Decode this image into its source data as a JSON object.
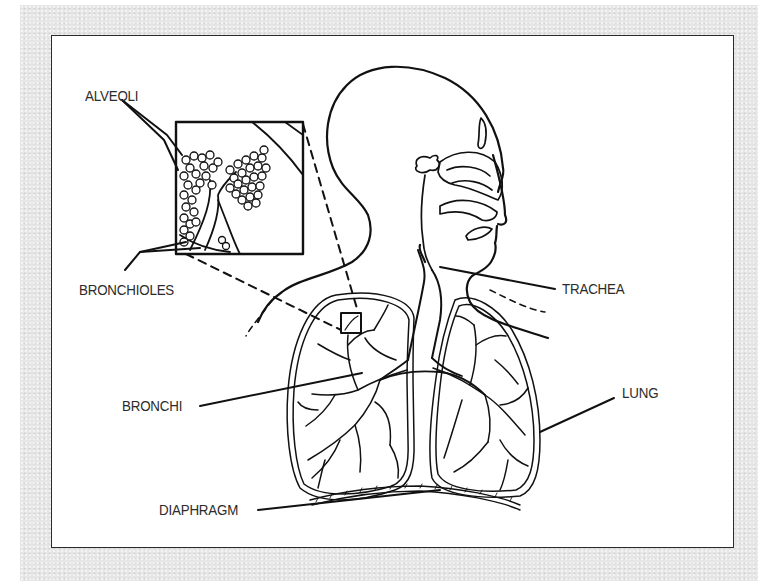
{
  "diagram": {
    "background_color": "#e6e6e6",
    "panel_color": "#ffffff",
    "line_color": "#111111",
    "labels": {
      "alveoli": "ALVEOLI",
      "bronchioles": "BRONCHIOLES",
      "bronchi": "BRONCHI",
      "diaphragm": "DIAPHRAGM",
      "trachea": "TRACHEA",
      "lung": "LUNG"
    },
    "parts": [
      {
        "name": "head-profile",
        "type": "outline"
      },
      {
        "name": "nasal-cavity",
        "type": "outline"
      },
      {
        "name": "trachea",
        "type": "tube"
      },
      {
        "name": "left-lung",
        "type": "organ"
      },
      {
        "name": "right-lung",
        "type": "organ"
      },
      {
        "name": "bronchial-tree",
        "type": "branches"
      },
      {
        "name": "diaphragm",
        "type": "muscle"
      },
      {
        "name": "alveoli-inset",
        "type": "magnified-view"
      }
    ]
  }
}
